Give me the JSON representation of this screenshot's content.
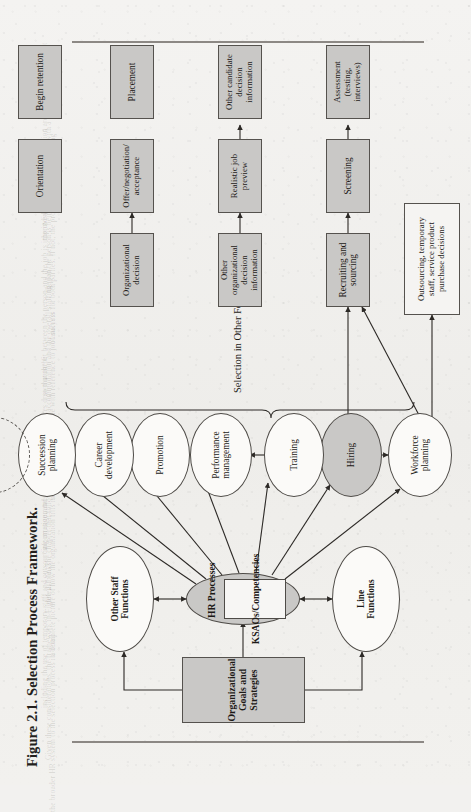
{
  "figure": {
    "caption": "Figure 2.1.  Selection Process Framework.",
    "bracket_label": "Selection in Other Forms"
  },
  "strategy": {
    "goals_box": "Organizational Goals and Strategies"
  },
  "functions": {
    "line": "Line\nFunctions",
    "other_staff": "Other Staff\nFunctions"
  },
  "hr": {
    "title": "HR Processes",
    "ksao": "KSAOs/Competencies"
  },
  "processes": [
    {
      "id": "workforce-planning",
      "label": "Workforce\nplanning",
      "style": "white"
    },
    {
      "id": "hiring",
      "label": "Hiring",
      "style": "gray"
    },
    {
      "id": "training",
      "label": "Training",
      "style": "white"
    },
    {
      "id": "performance-management",
      "label": "Performance\nmanagement",
      "style": "white"
    },
    {
      "id": "promotion",
      "label": "Promotion",
      "style": "white"
    },
    {
      "id": "career-development",
      "label": "Career\ndevelopment",
      "style": "white"
    },
    {
      "id": "succession-planning",
      "label": "Succession\nplanning",
      "style": "white"
    },
    {
      "id": "compensation",
      "label": "Compensation",
      "style": "dashed"
    }
  ],
  "outsourcing": {
    "label": "Outsourcing, temporary\nstaff, service product\npurchase decisions"
  },
  "selection_steps": [
    {
      "id": "recruiting-and-sourcing",
      "label": "Recruiting and\nsourcing"
    },
    {
      "id": "screening",
      "label": "Screening"
    },
    {
      "id": "assessment",
      "label": "Assessment\n(testing, interviews)"
    },
    {
      "id": "other-organizational-decision-information",
      "label": "Other organizational\ndecision information"
    },
    {
      "id": "realistic-job-preview",
      "label": "Realistic job preview"
    },
    {
      "id": "other-candidate-decision-information",
      "label": "Other candidate\ndecision information"
    },
    {
      "id": "organizational-decision",
      "label": "Organizational\ndecision"
    },
    {
      "id": "offer-negotiation-acceptance",
      "label": "Offer/negotiation/\nacceptance"
    },
    {
      "id": "placement",
      "label": "Placement"
    },
    {
      "id": "orientation",
      "label": "Orientation"
    },
    {
      "id": "begin-retention",
      "label": "Begin retention"
    }
  ],
  "colors": {
    "page": "#f2f1ef",
    "box_fill": "#c9c8c6",
    "stroke": "#4e4b47",
    "text": "#1d1a17"
  },
  "ghost_text": [
    "the individual and the organization are well matched, and that",
    "the job the person is being placed in a position with a high probability",
    "of success for both parties. If not, the process may need revisiting",
    "so that the fit between the person and the job is improved.",
    "reasonable accommodation and the overall staffing plan.",
    "selection decisions are made with reference to job analysis",
    "information, and the validity of the inferences drawn must be",
    "defensible. The chapter that follows develops these themes.",
    "a complete picture of how the organization fills its openings,",
    "including the use of temporary staff and outsourcing arrangements.",
    "Given these considerations, the framework in Figure 2.1 links",
    "the broader HR system to the selection process in detail."
  ]
}
